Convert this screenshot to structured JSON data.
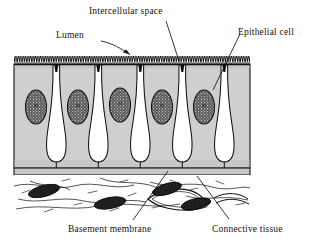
{
  "figure": {
    "kind": "histology-diagram"
  },
  "labels": {
    "intercellular_space": "Intercellular space",
    "lumen": "Lumen",
    "epithelial_cell": "Epithelial cell",
    "basement_membrane": "Basement membrane",
    "connective_tissue": "Connective tissue"
  },
  "colors": {
    "ink": "#15100c",
    "cytoplasm": "#cfcfcf",
    "cytoplasm_shade": "#bdbdbd",
    "basement_membrane": "#c6c6c6",
    "nucleus_fill": "#4a4a4a",
    "nucleus_stipple": "#e8e8e8",
    "fibroblast_nucleus": "#121212",
    "intercellular_space": "#ffffff",
    "background": "#ffffff"
  },
  "structures": {
    "brush_border": {
      "name": "microvilli",
      "tooth_count": 96,
      "top_y": 56,
      "height": 9
    },
    "epithelium": {
      "left": 14,
      "right": 250,
      "top": 56,
      "bottom": 168
    },
    "basement_membrane_band": {
      "top": 168,
      "height": 7
    },
    "connective_tissue": {
      "top": 175,
      "bottom": 215
    },
    "epithelial_cells": {
      "count": 6
    },
    "intercellular_spaces": {
      "count": 5
    },
    "epithelial_nuclei": {
      "count": 5
    },
    "fibroblast_nuclei": {
      "count": 4
    },
    "capillary": {
      "count": 1
    }
  },
  "leaders": [
    {
      "name": "lumen-leader",
      "from": [
        100,
        41
      ],
      "to": [
        133,
        56
      ]
    },
    {
      "name": "intercellular-space-leader",
      "from": [
        166,
        21
      ],
      "to": [
        179,
        61
      ]
    },
    {
      "name": "epithelial-cell-leader",
      "from": [
        240,
        34
      ],
      "to": [
        213,
        90
      ]
    },
    {
      "name": "basement-membrane-leader",
      "from": [
        132,
        221
      ],
      "to": [
        167,
        172
      ]
    },
    {
      "name": "connective-tissue-leader",
      "from": [
        228,
        220
      ],
      "to": [
        196,
        177
      ]
    }
  ]
}
